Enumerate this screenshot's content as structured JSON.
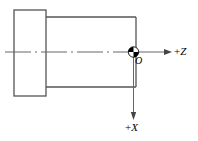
{
  "figure": {
    "type": "engineering-diagram",
    "background_color": "#ffffff",
    "line_color": "#555555",
    "axis_color": "#666666",
    "origin_marker_color": "#000000",
    "text_color": "#000000"
  },
  "labels": {
    "z_axis": {
      "sign": "+",
      "letter": "Z",
      "full": "+Z"
    },
    "x_axis": {
      "sign": "+",
      "letter": "X",
      "full": "+X"
    },
    "origin": "O"
  },
  "geometry": {
    "flange": {
      "x": 14,
      "y": 10,
      "width": 32,
      "height": 86
    },
    "shaft": {
      "x": 46,
      "y": 17,
      "width": 90,
      "height": 70
    },
    "centerline": {
      "y": 52,
      "x_start": 5,
      "x_end": 133
    },
    "origin_point": {
      "x": 133.5,
      "y": 52,
      "radius": 5
    },
    "z_arrow": {
      "x_start": 139,
      "x_end": 172,
      "y": 52
    },
    "x_arrow": {
      "x": 133.5,
      "y_start": 58,
      "y_end": 120
    }
  }
}
